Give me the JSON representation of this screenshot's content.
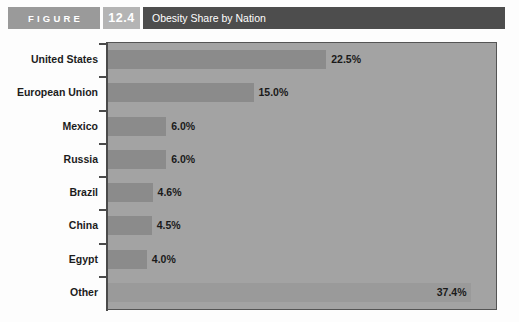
{
  "header": {
    "figure_label": "FIGURE",
    "figure_number": "12.4",
    "title": "Obesity Share by Nation",
    "colors": {
      "figure_box": "#9a9a9a",
      "number_box": "#b4b4b4",
      "title_bar": "#4d4d4d"
    }
  },
  "chart_data": {
    "type": "bar",
    "orientation": "horizontal",
    "title": "Obesity Share by Nation",
    "xlabel": "",
    "ylabel": "",
    "xlim": [
      0,
      40
    ],
    "grid": false,
    "legend": "none",
    "plot_background": "#a3a3a3",
    "bar_color": "#8b8b8b",
    "categories": [
      "United States",
      "European Union",
      "Mexico",
      "Russia",
      "Brazil",
      "China",
      "Egypt",
      "Other"
    ],
    "values": [
      22.5,
      15.0,
      6.0,
      6.0,
      4.6,
      4.5,
      4.0,
      37.4
    ],
    "value_labels": [
      "22.5%",
      "15.0%",
      "6.0%",
      "6.0%",
      "4.6%",
      "4.5%",
      "4.0%",
      "37.4%"
    ]
  }
}
